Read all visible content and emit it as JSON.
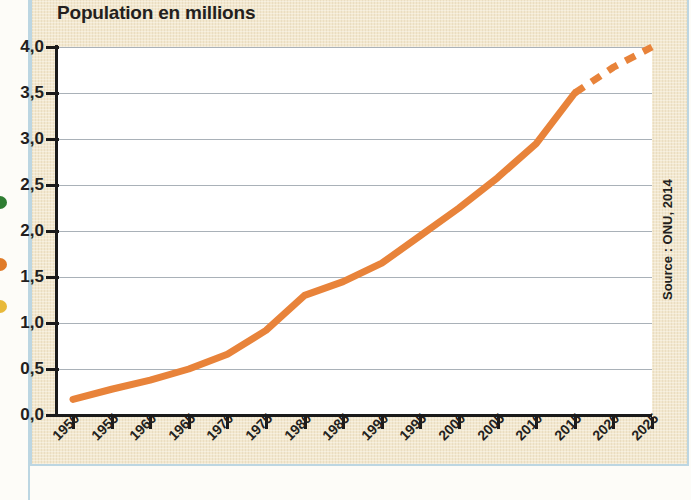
{
  "figure": {
    "title": "Population en millions",
    "source_note": "Source : ONU, 2014",
    "line_color": "#e8833a",
    "grid_color": "#9aa3ab",
    "axis_color": "#1a1a1a",
    "panel_color": "#f3e8cf",
    "border_color": "#bcd6e2",
    "plot_color": "#ffffff"
  },
  "margin_bullets": [
    {
      "name": "bullet-green",
      "color": "#2e7d32"
    },
    {
      "name": "bullet-orange",
      "color": "#e07b28"
    },
    {
      "name": "bullet-yellow",
      "color": "#e8b93a"
    }
  ],
  "chart_data": {
    "type": "line",
    "title": "Population en millions",
    "xlabel": "",
    "ylabel": "Population en millions",
    "grid": true,
    "legend": false,
    "xlim": [
      1950,
      2025
    ],
    "ylim": [
      0.0,
      4.0
    ],
    "ytick_labels": [
      "0,0",
      "0,5",
      "1,0",
      "1,5",
      "2,0",
      "2,5",
      "3,0",
      "3,5",
      "4,0"
    ],
    "ytick_values": [
      0.0,
      0.5,
      1.0,
      1.5,
      2.0,
      2.5,
      3.0,
      3.5,
      4.0
    ],
    "xtick_labels": [
      "1950",
      "1955",
      "1960",
      "1965",
      "1970",
      "1975",
      "1980",
      "1985",
      "1990",
      "1995",
      "2000",
      "2005",
      "2010",
      "2015",
      "2020",
      "2025"
    ],
    "xtick_values": [
      1950,
      1955,
      1960,
      1965,
      1970,
      1975,
      1980,
      1985,
      1990,
      1995,
      2000,
      2005,
      2010,
      2015,
      2020,
      2025
    ],
    "series": [
      {
        "name": "Population observée",
        "style": "solid",
        "color": "#e8833a",
        "x": [
          1950,
          1955,
          1960,
          1965,
          1970,
          1975,
          1980,
          1985,
          1990,
          1995,
          2000,
          2005,
          2010,
          2015
        ],
        "values": [
          0.17,
          0.28,
          0.38,
          0.5,
          0.66,
          0.92,
          1.3,
          1.45,
          1.65,
          1.95,
          2.25,
          2.58,
          2.95,
          3.5
        ]
      },
      {
        "name": "Projection",
        "style": "dashed",
        "color": "#e8833a",
        "x": [
          2015,
          2020,
          2025
        ],
        "values": [
          3.5,
          3.78,
          4.0
        ]
      }
    ],
    "annotations": [
      {
        "text": "Source : ONU, 2014",
        "position": "right-margin",
        "rotation": -90
      }
    ]
  }
}
